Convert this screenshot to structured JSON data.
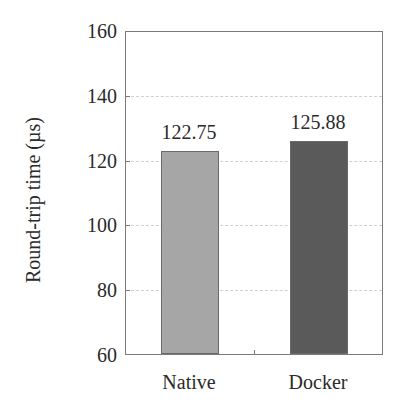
{
  "chart_data": {
    "type": "bar",
    "title": "",
    "xlabel": "",
    "ylabel": "Round-trip time (µs)",
    "categories": [
      "Native",
      "Docker"
    ],
    "values": [
      122.75,
      125.88
    ],
    "value_labels": [
      "122.75",
      "125.88"
    ],
    "bar_colors": [
      "#a6a6a6",
      "#5a5a5a"
    ],
    "ylim": [
      60,
      160
    ],
    "yticks": [
      60,
      80,
      100,
      120,
      140,
      160
    ],
    "ytick_labels": [
      "60",
      "80",
      "100",
      "120",
      "140",
      "160"
    ],
    "grid": {
      "y": true,
      "style": "dashed",
      "color": "#d0d0d0"
    },
    "legend": null
  }
}
